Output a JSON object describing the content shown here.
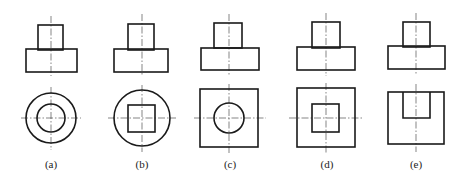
{
  "figure": {
    "stroke_color": "#1a1a1a",
    "panels": [
      {
        "id": "a",
        "label": "(a)",
        "center_x": 51,
        "front_view": {
          "upper_rect": [
            38,
            25,
            63,
            50
          ],
          "lower_rect": [
            26,
            49,
            77,
            72
          ]
        },
        "top_view": {
          "outer": {
            "shape": "circle",
            "cx": 51,
            "cy": 118,
            "r": 25
          },
          "inner": {
            "shape": "circle",
            "cx": 51,
            "cy": 118,
            "r": 14
          }
        }
      },
      {
        "id": "b",
        "label": "(b)",
        "center_x": 142,
        "front_view": {
          "upper_rect": [
            128,
            24,
            154,
            50
          ],
          "lower_rect": [
            114,
            49,
            168,
            72
          ]
        },
        "top_view": {
          "outer": {
            "shape": "circle",
            "cx": 142,
            "cy": 118,
            "r": 28
          },
          "inner": {
            "shape": "square",
            "x1": 128,
            "y1": 105,
            "x2": 155,
            "y2": 132
          }
        }
      },
      {
        "id": "c",
        "label": "(c)",
        "center_x": 229,
        "front_view": {
          "upper_rect": [
            214,
            23,
            242,
            48
          ],
          "lower_rect": [
            201,
            48,
            259,
            70
          ]
        },
        "top_view": {
          "outer": {
            "shape": "square",
            "x1": 200,
            "y1": 89,
            "x2": 258,
            "y2": 147
          },
          "inner": {
            "shape": "circle",
            "cx": 229,
            "cy": 118,
            "r": 15
          }
        }
      },
      {
        "id": "d",
        "label": "(d)",
        "center_x": 326,
        "front_view": {
          "upper_rect": [
            312,
            22,
            340,
            48
          ],
          "lower_rect": [
            297,
            47,
            355,
            70
          ]
        },
        "top_view": {
          "outer": {
            "shape": "square",
            "x1": 297,
            "y1": 88,
            "x2": 355,
            "y2": 147
          },
          "inner": {
            "shape": "square",
            "x1": 312,
            "y1": 104,
            "x2": 339,
            "y2": 132
          }
        }
      },
      {
        "id": "e",
        "label": "(e)",
        "center_x": 416,
        "front_view": {
          "upper_rect": [
            403,
            22,
            430,
            47
          ],
          "lower_rect": [
            388,
            46,
            445,
            69
          ]
        },
        "top_view": {
          "outer": {
            "shape": "square",
            "x1": 388,
            "y1": 92,
            "x2": 444,
            "y2": 144
          },
          "inner": {
            "shape": "u-notch",
            "x1": 403,
            "y1": 92,
            "x2": 430,
            "y2": 118
          }
        }
      }
    ]
  }
}
